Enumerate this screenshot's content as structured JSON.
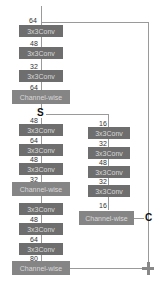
{
  "diagram": {
    "input_channels": "64",
    "stage1": {
      "convs": [
        {
          "label": "3x3Conv",
          "in": "64"
        },
        {
          "label": "3x3Conv",
          "in": "48"
        },
        {
          "label": "3x3Conv",
          "in": "32"
        }
      ],
      "channelwise": {
        "label": "Channel-wise",
        "in": "64"
      }
    },
    "split_op": "S",
    "left_branch": {
      "convs": [
        {
          "label": "3x3Conv",
          "in": "48"
        },
        {
          "label": "3x3Conv",
          "in": "64"
        },
        {
          "label": "3x3Conv",
          "in": "48"
        }
      ],
      "channelwise": {
        "label": "Channel-wise",
        "in": "32"
      }
    },
    "right_branch": {
      "convs": [
        {
          "label": "3x3Conv",
          "in": "16"
        },
        {
          "label": "3x3Conv",
          "in": "32"
        },
        {
          "label": "3x3Conv",
          "in": "48"
        },
        {
          "label": "3x3Conv",
          "in": "32"
        }
      ],
      "channelwise": {
        "label": "Channel-wise",
        "in": "16"
      }
    },
    "stage3": {
      "convs": [
        {
          "label": "3x3Conv",
          "in": ""
        },
        {
          "label": "3x3Conv",
          "in": "48"
        },
        {
          "label": "3x3Conv",
          "in": "64"
        }
      ],
      "channelwise": {
        "label": "Channel-wise",
        "in": "80"
      }
    },
    "concat_op": "C",
    "add_op": "+",
    "colors": {
      "block": "#6e6e6e",
      "channelwise": "#858585",
      "line": "#9a9a9a"
    }
  }
}
